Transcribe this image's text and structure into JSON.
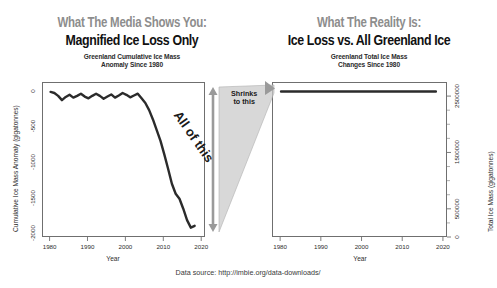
{
  "figure": {
    "background": "#ffffff",
    "source_note": "Data source: http://imbie.org/data-downloads/",
    "accent_gray": "#8d8d8d",
    "ink": "#111111"
  },
  "left_panel": {
    "kicker": "What The Media Shows You:",
    "headline": "Magnified Ice Loss Only",
    "subtitle_line1": "Greenland Cumulative Ice Mass",
    "subtitle_line2": "Anomaly Since 1980"
  },
  "right_panel": {
    "kicker": "What The Reality Is:",
    "headline": "Ice Loss vs. All Greenland Ice",
    "subtitle_line1": "Greenland Total Ice Mass",
    "subtitle_line2": "Changes Since 1980"
  },
  "annotations": {
    "all_of_this": "All of this",
    "shrinks_line1": "Shrinks",
    "shrinks_line2": "to this"
  },
  "chart_data": [
    {
      "id": "left",
      "type": "line",
      "title": "Greenland Cumulative Ice Mass Anomaly Since 1980",
      "xlabel": "Year",
      "ylabel": "Cumulative Ice Mass Anomaly (gigatonnes)",
      "xlim": [
        1978,
        2021
      ],
      "ylim": [
        -2050,
        120
      ],
      "xticks": [
        1980,
        1990,
        2000,
        2010,
        2020
      ],
      "xticklabels": [
        "1980",
        "1990",
        "2000",
        "2010",
        "2020"
      ],
      "yticks": [
        0,
        -500,
        -1000,
        -1500,
        -2000
      ],
      "yticklabels": [
        "0",
        "-500",
        "-1000",
        "-1500",
        "-2000"
      ],
      "grid": false,
      "legend": "none",
      "series": [
        {
          "name": "Cumulative ice mass anomaly",
          "color": "#2b2b2b",
          "x": [
            1980,
            1981,
            1982,
            1983,
            1984,
            1985,
            1986,
            1987,
            1988,
            1989,
            1990,
            1991,
            1992,
            1993,
            1994,
            1995,
            1996,
            1997,
            1998,
            1999,
            2000,
            2001,
            2002,
            2003,
            2004,
            2005,
            2006,
            2007,
            2008,
            2009,
            2010,
            2011,
            2012,
            2013,
            2014,
            2015,
            2016,
            2017,
            2018
          ],
          "values": [
            -5,
            -20,
            -60,
            -120,
            -75,
            -45,
            -85,
            -60,
            -30,
            -70,
            -95,
            -60,
            -30,
            -60,
            -100,
            -70,
            -40,
            -85,
            -55,
            -20,
            -45,
            -80,
            -55,
            -30,
            -95,
            -160,
            -260,
            -390,
            -540,
            -690,
            -880,
            -1080,
            -1290,
            -1430,
            -1500,
            -1640,
            -1800,
            -1905,
            -1880
          ]
        }
      ]
    },
    {
      "id": "right",
      "type": "line",
      "title": "Greenland Total Ice Mass Changes Since 1980",
      "xlabel": "Year",
      "ylabel": "Total Ice Mass (gigatonnes)",
      "xlim": [
        1978,
        2021
      ],
      "ylim": [
        0,
        2750000
      ],
      "xticks": [
        1980,
        1990,
        2000,
        2010,
        2020
      ],
      "xticklabels": [
        "1980",
        "1990",
        "2000",
        "2010",
        "2020"
      ],
      "yticks": [
        0,
        500000,
        1500000,
        2500000
      ],
      "yticklabels": [
        "0",
        "500000",
        "1500000",
        "2500000"
      ],
      "grid": false,
      "legend": "none",
      "series": [
        {
          "name": "Total Greenland ice mass",
          "color": "#2b2b2b",
          "x": [
            1980,
            1985,
            1990,
            1995,
            2000,
            2005,
            2010,
            2015,
            2018
          ],
          "values": [
            2600000,
            2599955,
            2599905,
            2599930,
            2599955,
            2599840,
            2599120,
            2598360,
            2598120
          ]
        }
      ]
    }
  ]
}
